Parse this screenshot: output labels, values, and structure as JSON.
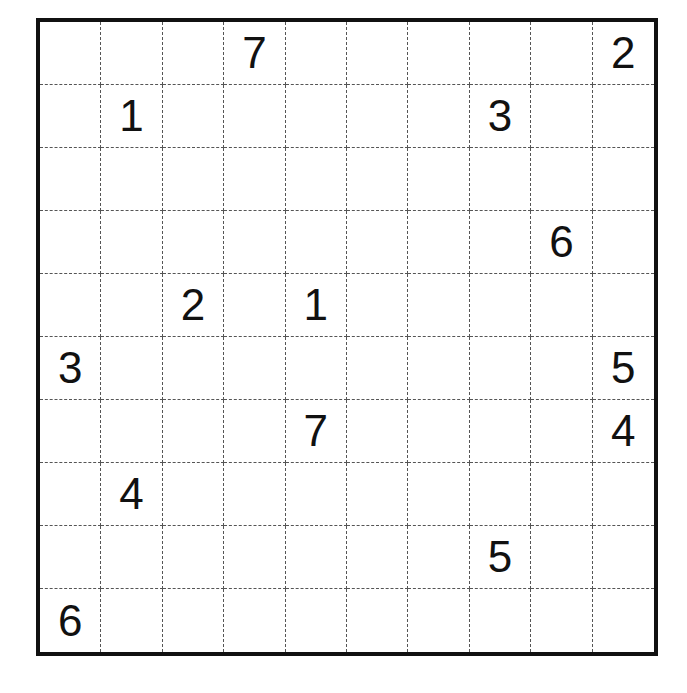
{
  "puzzle": {
    "rows": 10,
    "cols": 10,
    "grid": [
      [
        "",
        "",
        "",
        "7",
        "",
        "",
        "",
        "",
        "",
        "2"
      ],
      [
        "",
        "1",
        "",
        "",
        "",
        "",
        "",
        "3",
        "",
        ""
      ],
      [
        "",
        "",
        "",
        "",
        "",
        "",
        "",
        "",
        "",
        ""
      ],
      [
        "",
        "",
        "",
        "",
        "",
        "",
        "",
        "",
        "6",
        ""
      ],
      [
        "",
        "",
        "2",
        "",
        "1",
        "",
        "",
        "",
        "",
        ""
      ],
      [
        "3",
        "",
        "",
        "",
        "",
        "",
        "",
        "",
        "",
        "5"
      ],
      [
        "",
        "",
        "",
        "",
        "7",
        "",
        "",
        "",
        "",
        "4"
      ],
      [
        "",
        "4",
        "",
        "",
        "",
        "",
        "",
        "",
        "",
        ""
      ],
      [
        "",
        "",
        "",
        "",
        "",
        "",
        "",
        "5",
        "",
        ""
      ],
      [
        "6",
        "",
        "",
        "",
        "",
        "",
        "",
        "",
        "",
        ""
      ]
    ]
  },
  "colors": {
    "border": "#111111",
    "grid_line": "#555555",
    "digit": "#111111",
    "background": "#ffffff"
  }
}
